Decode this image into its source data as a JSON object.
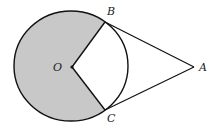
{
  "figure": {
    "width": 217,
    "height": 133,
    "colors": {
      "background": "#ffffff",
      "shade": "#c8c8c8",
      "stroke": "#111111"
    },
    "circle": {
      "cx": 71,
      "cy": 66,
      "rx": 57,
      "ry": 55
    },
    "points": {
      "O": {
        "x": 72,
        "y": 67,
        "label": "O",
        "lx": 53,
        "ly": 71
      },
      "B": {
        "x": 105,
        "y": 22,
        "label": "B",
        "lx": 107,
        "ly": 15
      },
      "C": {
        "x": 105,
        "y": 110,
        "label": "C",
        "lx": 107,
        "ly": 122
      },
      "A": {
        "x": 194,
        "y": 67,
        "label": "A",
        "lx": 199,
        "ly": 71
      }
    },
    "segments": [
      "OB",
      "OC",
      "BA",
      "CA"
    ],
    "shaded_region": "major sector BOC"
  }
}
